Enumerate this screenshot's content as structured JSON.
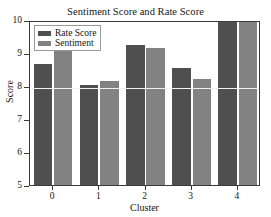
{
  "chart_data": {
    "type": "bar",
    "title": "Sentiment Score and Rate Score",
    "xlabel": "Cluster",
    "ylabel": "Score",
    "categories": [
      "0",
      "1",
      "2",
      "3",
      "4"
    ],
    "series": [
      {
        "name": "Rate Score",
        "color": "#4f4f4f",
        "values": [
          8.68,
          8.02,
          9.23,
          8.55,
          9.95
        ]
      },
      {
        "name": "Sentiment",
        "color": "#828282",
        "values": [
          9.2,
          8.15,
          9.15,
          8.22,
          10.02
        ]
      }
    ],
    "ylim": [
      5,
      10
    ],
    "yticks": [
      5,
      6,
      7,
      8,
      9,
      10
    ],
    "ytick_labels": [
      "5",
      "6",
      "7",
      "8",
      "9",
      "10"
    ],
    "xticks": [
      0,
      1,
      2,
      3,
      4
    ],
    "grid": true,
    "gridlines_y": [
      8
    ],
    "legend_position": "upper left",
    "legend_entries": [
      "Rate Score",
      "Sentiment"
    ]
  },
  "figure": {
    "background": "#ffffff",
    "axes_edge_color": "#3a3a3a",
    "grid_color": "#f2f2f2"
  }
}
